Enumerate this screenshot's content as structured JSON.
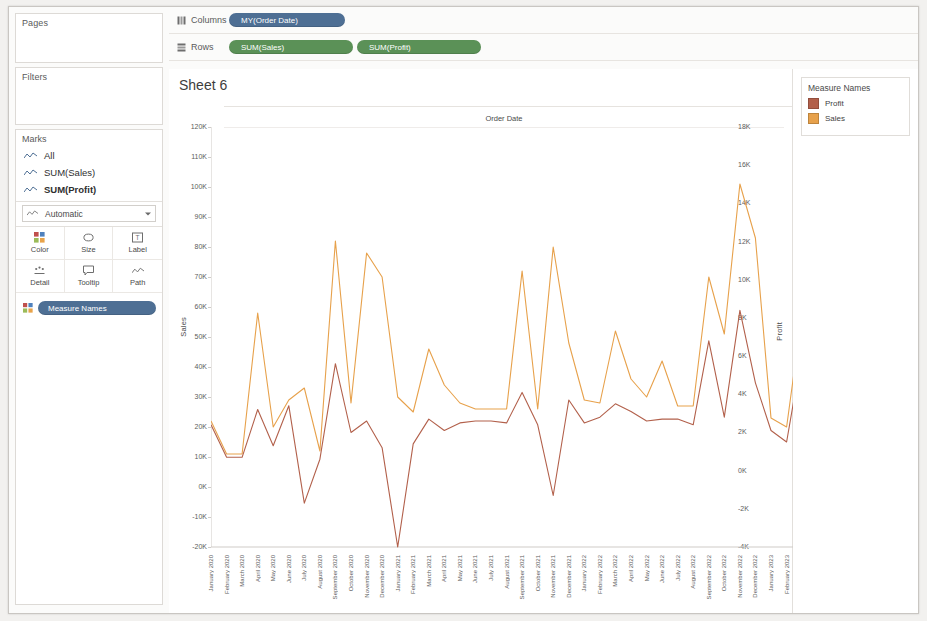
{
  "panels": {
    "pages_label": "Pages",
    "filters_label": "Filters",
    "marks_label": "Marks"
  },
  "marks": {
    "items": [
      {
        "label": "All",
        "bold": false
      },
      {
        "label": "SUM(Sales)",
        "bold": false
      },
      {
        "label": "SUM(Profit)",
        "bold": true
      }
    ],
    "mark_type": "Automatic",
    "buttons": [
      {
        "label": "Color",
        "icon": "color-icon"
      },
      {
        "label": "Size",
        "icon": "size-icon"
      },
      {
        "label": "Label",
        "icon": "label-icon"
      },
      {
        "label": "Detail",
        "icon": "detail-icon"
      },
      {
        "label": "Tooltip",
        "icon": "tooltip-icon"
      },
      {
        "label": "Path",
        "icon": "path-icon"
      }
    ],
    "color_pill": "Measure Names"
  },
  "shelves": {
    "columns_label": "Columns",
    "rows_label": "Rows",
    "columns_pills": [
      "MY(Order Date)"
    ],
    "rows_pills": [
      "SUM(Sales)",
      "SUM(Profit)"
    ]
  },
  "sheet": {
    "title": "Sheet 6",
    "column_header": "Order Date"
  },
  "legend": {
    "title": "Measure Names",
    "items": [
      {
        "label": "Profit",
        "color": "#b2604b"
      },
      {
        "label": "Sales",
        "color": "#e7a14b"
      }
    ]
  },
  "chart_data": {
    "type": "line",
    "title": "Sheet 6",
    "xlabel": "Order Date",
    "grid": false,
    "legend_position": "right",
    "axes": {
      "left": {
        "name": "Sales",
        "ticks": [
          "120K",
          "110K",
          "100K",
          "90K",
          "80K",
          "70K",
          "60K",
          "50K",
          "40K",
          "30K",
          "20K",
          "10K",
          "0K",
          "-10K",
          "-20K"
        ],
        "min": -20000,
        "max": 120000
      },
      "right": {
        "name": "Profit",
        "ticks": [
          "18K",
          "16K",
          "14K",
          "12K",
          "10K",
          "8K",
          "6K",
          "4K",
          "2K",
          "0K",
          "-2K",
          "-4K"
        ],
        "min": -4000,
        "max": 18000
      }
    },
    "categories": [
      "January 2020",
      "February 2020",
      "March 2020",
      "April 2020",
      "May 2020",
      "June 2020",
      "July 2020",
      "August 2020",
      "September 2020",
      "October 2020",
      "November 2020",
      "December 2020",
      "January 2021",
      "February 2021",
      "March 2021",
      "April 2021",
      "May 2021",
      "June 2021",
      "July 2021",
      "August 2021",
      "September 2021",
      "October 2021",
      "November 2021",
      "December 2021",
      "January 2022",
      "February 2022",
      "March 2022",
      "April 2022",
      "May 2022",
      "June 2022",
      "July 2022",
      "August 2022",
      "September 2022",
      "October 2022",
      "November 2022",
      "December 2022",
      "January 2023",
      "February 2023",
      "March 2023",
      "April 2023",
      "May 2023",
      "June 2023",
      "July 2023",
      "August 2023",
      "September 2023",
      "October 2023"
    ],
    "series": [
      {
        "name": "Sales",
        "axis": "left",
        "color": "#e7a14b",
        "values": [
          22000,
          11000,
          11000,
          58000,
          20000,
          29000,
          33000,
          12000,
          82000,
          28000,
          78000,
          70000,
          30000,
          25000,
          46000,
          34000,
          28000,
          26000,
          26000,
          26000,
          72000,
          26000,
          80000,
          48000,
          29000,
          28000,
          52000,
          36000,
          30000,
          42000,
          27000,
          27000,
          70000,
          51000,
          101000,
          83000,
          23000,
          20000,
          58000,
          18000,
          38000,
          36000,
          42000,
          70000,
          91000,
          88000
        ]
      },
      {
        "name": "Profit",
        "axis": "right",
        "color": "#b2604b",
        "values": [
          2400,
          700,
          700,
          3200,
          1300,
          3400,
          -1700,
          600,
          5600,
          2000,
          2600,
          1200,
          -4000,
          1400,
          2700,
          2100,
          2500,
          2600,
          2600,
          2500,
          4100,
          2400,
          -1300,
          3700,
          2500,
          2800,
          3500,
          3100,
          2600,
          2700,
          2700,
          2400,
          6800,
          2800,
          8400,
          4600,
          2100,
          1500,
          6200,
          1300,
          3500,
          3400,
          4200,
          5500,
          9700,
          10200
        ]
      }
    ]
  }
}
